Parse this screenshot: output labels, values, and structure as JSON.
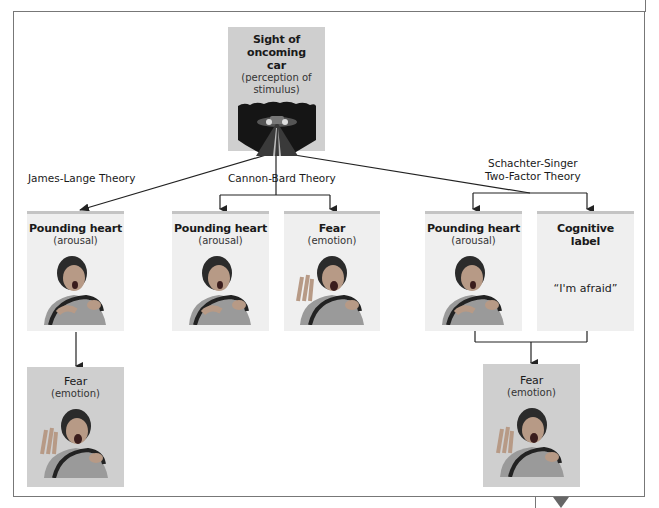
{
  "stimulus": {
    "title_line1": "Sight of oncoming",
    "title_line2": "car",
    "sub_line1": "(perception of",
    "sub_line2": "stimulus)",
    "image": "road-with-oncoming-car-headlights"
  },
  "theories": {
    "james_lange": {
      "label": "James-Lange Theory",
      "first": {
        "title": "Pounding heart",
        "sub": "(arousal)",
        "image": "person-gripping-steering-wheel-hand-on-chest"
      },
      "result": {
        "title": "Fear",
        "sub": "(emotion)",
        "image": "person-screaming-hand-raised"
      }
    },
    "cannon_bard": {
      "label": "Cannon-Bard Theory",
      "left": {
        "title": "Pounding heart",
        "sub": "(arousal)",
        "image": "person-gripping-steering-wheel-hand-on-chest"
      },
      "right": {
        "title": "Fear",
        "sub": "(emotion)",
        "image": "person-screaming-hand-raised"
      }
    },
    "schachter_singer": {
      "label_line1": "Schachter-Singer",
      "label_line2": "Two-Factor Theory",
      "left": {
        "title": "Pounding heart",
        "sub": "(arousal)",
        "image": "person-gripping-steering-wheel-hand-on-chest"
      },
      "right": {
        "title_line1": "Cognitive",
        "title_line2": "label",
        "quote": "“I'm afraid”"
      },
      "result": {
        "title": "Fear",
        "sub": "(emotion)",
        "image": "person-screaming-hand-raised"
      }
    }
  },
  "colors": {
    "light_box": "#efefef",
    "light_box_top_border": "#c4c4c4",
    "dark_box": "#cfcfcf",
    "lines": "#222222",
    "frame": "#777777"
  }
}
